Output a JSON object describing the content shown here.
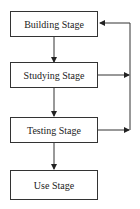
{
  "diagram": {
    "type": "flowchart",
    "nodes": [
      {
        "id": "building",
        "label": "Building Stage"
      },
      {
        "id": "studying",
        "label": "Studying Stage"
      },
      {
        "id": "testing",
        "label": "Testing Stage"
      },
      {
        "id": "use",
        "label": "Use Stage"
      }
    ],
    "edges": [
      {
        "from": "building",
        "to": "studying"
      },
      {
        "from": "studying",
        "to": "testing"
      },
      {
        "from": "testing",
        "to": "use"
      },
      {
        "from": "studying",
        "to": "feedback-line"
      },
      {
        "from": "testing",
        "to": "feedback-line"
      },
      {
        "from": "feedback-line",
        "to": "building"
      }
    ],
    "colors": {
      "stroke": "#333333",
      "background": "#ffffff"
    }
  }
}
